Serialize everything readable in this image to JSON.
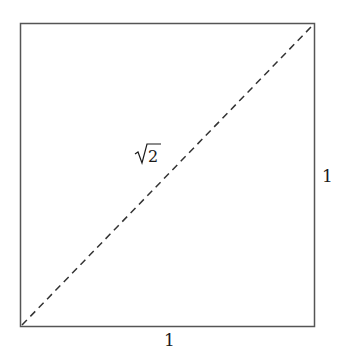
{
  "diagram": {
    "labels": {
      "diagonal": "√2",
      "diagonal_radicand": "2",
      "side_right": "1",
      "side_bottom": "1"
    },
    "colors": {
      "stroke": "#555555",
      "dash": "#333333",
      "text": "#1a1a1a"
    }
  }
}
